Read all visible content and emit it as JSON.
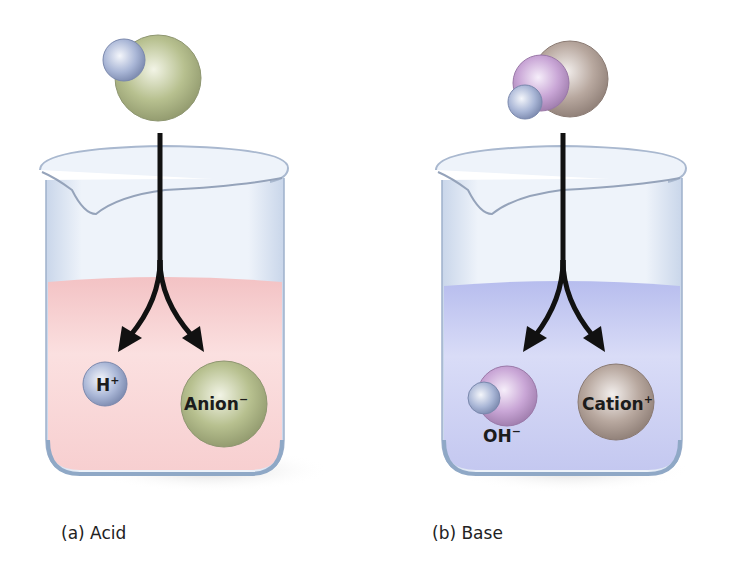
{
  "panels": [
    {
      "id": "acid",
      "caption": "(a) Acid",
      "solution_color": "#f6c9c9",
      "products": [
        {
          "name": "H",
          "charge": "+"
        },
        {
          "name": "Anion",
          "charge": "−"
        }
      ]
    },
    {
      "id": "base",
      "caption": "(b) Base",
      "solution_color": "#c3c8f0",
      "products": [
        {
          "name": "OH",
          "charge": "−"
        },
        {
          "name": "Cation",
          "charge": "+"
        }
      ]
    }
  ],
  "colors": {
    "hydrogen": "#a9b6d6",
    "anion": "#b7c08f",
    "oxygen": "#c9a6d6",
    "cation": "#b8a89f",
    "arrow": "#111111",
    "glass": "#dfe8f4"
  }
}
